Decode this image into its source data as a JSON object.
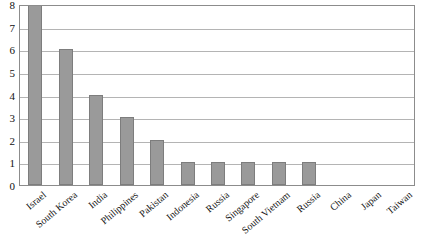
{
  "chart_data": {
    "type": "bar",
    "title": "",
    "subtitle": "",
    "xlabel": "",
    "ylabel": "",
    "ylim": [
      0,
      8
    ],
    "y_ticks": [
      "0",
      "1",
      "2",
      "3",
      "4",
      "5",
      "6",
      "7",
      "8"
    ],
    "grid": true,
    "legend": "none",
    "orientation": "vertical",
    "bar_color": "#9a9a9a",
    "bar_border_color": "#7d7d7d",
    "gridline_color": "#b4b4b4",
    "frame_color": "#8c8c8c",
    "categories": [
      "Israel",
      "South Korea",
      "India",
      "Philippines",
      "Pakistan",
      "Indonesia",
      "Russia",
      "Singapore",
      "South Vietnam",
      "Russia",
      "China",
      "Japan",
      "Taiwan"
    ],
    "values": [
      8,
      6,
      4,
      3,
      2,
      1,
      1,
      1,
      1,
      1,
      0,
      0,
      0
    ]
  }
}
